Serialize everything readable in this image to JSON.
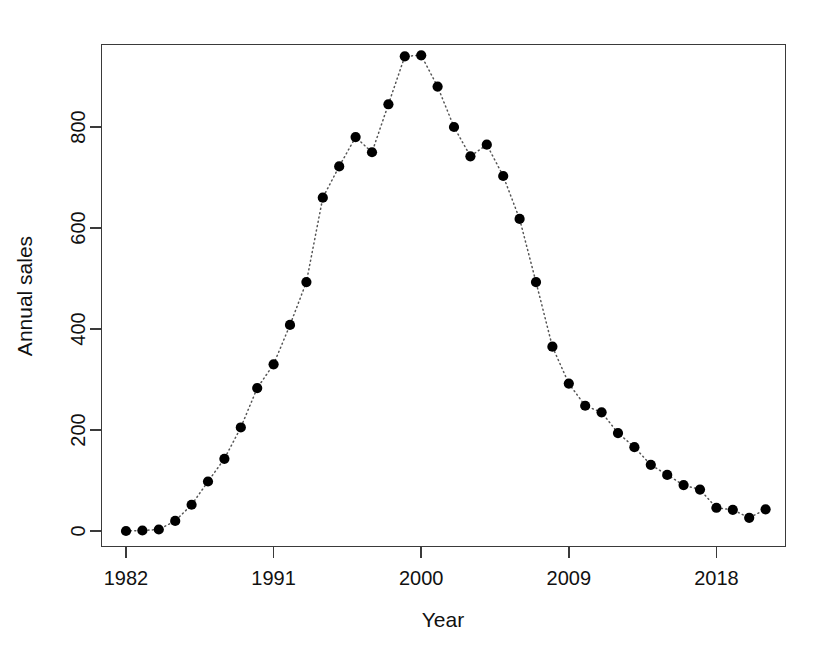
{
  "chart_data": {
    "type": "scatter",
    "title": "",
    "xlabel": "Year",
    "ylabel": "Annual sales",
    "x": [
      1982,
      1983,
      1984,
      1985,
      1986,
      1987,
      1988,
      1989,
      1990,
      1991,
      1992,
      1993,
      1994,
      1995,
      1996,
      1997,
      1998,
      1999,
      2000,
      2001,
      2002,
      2003,
      2004,
      2005,
      2006,
      2007,
      2008,
      2009,
      2010,
      2011,
      2012,
      2013,
      2014,
      2015,
      2016,
      2017,
      2018,
      2019,
      2020,
      2021
    ],
    "values": [
      0,
      1,
      3,
      20,
      52,
      98,
      143,
      205,
      283,
      330,
      408,
      493,
      660,
      722,
      780,
      750,
      845,
      940,
      942,
      880,
      800,
      742,
      765,
      703,
      618,
      493,
      365,
      292,
      248,
      235,
      194,
      166,
      131,
      111,
      91,
      82,
      46,
      42,
      26,
      43
    ],
    "series": [
      {
        "name": "Annual sales",
        "values": [
          0,
          1,
          3,
          20,
          52,
          98,
          143,
          205,
          283,
          330,
          408,
          493,
          660,
          722,
          780,
          750,
          845,
          940,
          942,
          880,
          800,
          742,
          765,
          703,
          618,
          493,
          365,
          292,
          248,
          235,
          194,
          166,
          131,
          111,
          91,
          82,
          46,
          42,
          26,
          43
        ]
      }
    ],
    "xlim": [
      1981.2,
      2021.8
    ],
    "ylim": [
      -30,
      975
    ],
    "xticks": [
      1982,
      1991,
      2000,
      2009,
      2018
    ],
    "xtick_labels": [
      "1982",
      "1991",
      "2000",
      "2009",
      "2018"
    ],
    "yticks": [
      0,
      200,
      400,
      600,
      800
    ],
    "ytick_labels": [
      "0",
      "200",
      "400",
      "600",
      "800"
    ],
    "grid": false,
    "legend": false,
    "marker": "filled-circle",
    "marker_color": "#000000",
    "connector_style": "dotted",
    "connector_color": "#555555",
    "box": true
  },
  "axes": {
    "x_title": "Year",
    "y_title": "Annual sales"
  }
}
